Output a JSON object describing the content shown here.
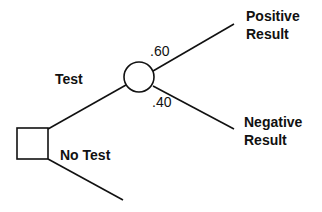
{
  "diagram": {
    "type": "decision-tree",
    "nodes": {
      "decision": {
        "shape": "square",
        "x": 17,
        "y": 128,
        "w": 31,
        "h": 31
      },
      "chance": {
        "shape": "circle",
        "cx": 139,
        "cy": 77,
        "r": 15
      }
    },
    "branches": {
      "test": {
        "label": "Test"
      },
      "no_test": {
        "label": "No Test"
      },
      "positive": {
        "label_line1": "Positive",
        "label_line2": "Result",
        "probability": ".60"
      },
      "negative": {
        "label_line1": "Negative",
        "label_line2": "Result",
        "probability": ".40"
      }
    },
    "colors": {
      "stroke": "#111111",
      "background": "#ffffff"
    }
  }
}
